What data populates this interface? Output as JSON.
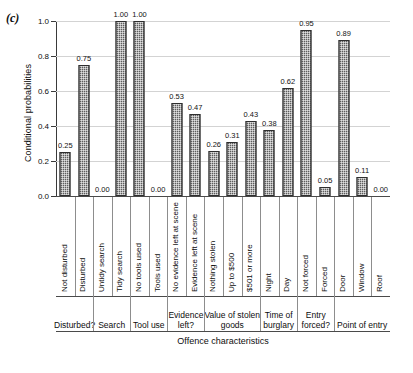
{
  "panel_label": "(c)",
  "chart_data": {
    "type": "bar",
    "title": "",
    "xlabel": "Offence characteristics",
    "ylabel": "Conditional probabilities",
    "ylim": [
      0.0,
      1.0
    ],
    "yticks": [
      "0.0",
      "0.2",
      "0.4",
      "0.6",
      "0.8",
      "1.0"
    ],
    "ytick_values": [
      0.0,
      0.2,
      0.4,
      0.6,
      0.8,
      1.0
    ],
    "grid": true,
    "legend": "none",
    "categories": [
      "Not disturbed",
      "Disturbed",
      "Untidy search",
      "Tidy search",
      "No tools used",
      "Tools used",
      "No evidence left at scene",
      "Evidence left at scene",
      "Nothing stolen",
      "Up to $500",
      "$501 or more",
      "Night",
      "Day",
      "Not forced",
      "Forced",
      "Door",
      "Window",
      "Roof"
    ],
    "values": [
      0.25,
      0.75,
      0.0,
      1.0,
      1.0,
      0.0,
      0.53,
      0.47,
      0.26,
      0.31,
      0.43,
      0.38,
      0.62,
      0.95,
      0.05,
      0.89,
      0.11,
      0.0
    ],
    "value_labels": [
      "0.25",
      "0.75",
      "0.00",
      "1.00",
      "1.00",
      "0.00",
      "0.53",
      "0.47",
      "0.26",
      "0.31",
      "0.43",
      "0.38",
      "0.62",
      "0.95",
      "0.05",
      "0.89",
      "0.11",
      "0.00"
    ],
    "groups": [
      {
        "label": "Disturbed?",
        "span": 2
      },
      {
        "label": "Search",
        "span": 2
      },
      {
        "label": "Tool use",
        "span": 2
      },
      {
        "label": "Evidence\nleft?",
        "span": 2
      },
      {
        "label": "Value of stolen\ngoods",
        "span": 3
      },
      {
        "label": "Time of\nburglary",
        "span": 2
      },
      {
        "label": "Entry\nforced?",
        "span": 2
      },
      {
        "label": "Point of entry",
        "span": 3
      }
    ],
    "bar_color": "#5d5d5d",
    "grid_color": "#d3d3d3",
    "axis_color": "#3a3a3a"
  }
}
